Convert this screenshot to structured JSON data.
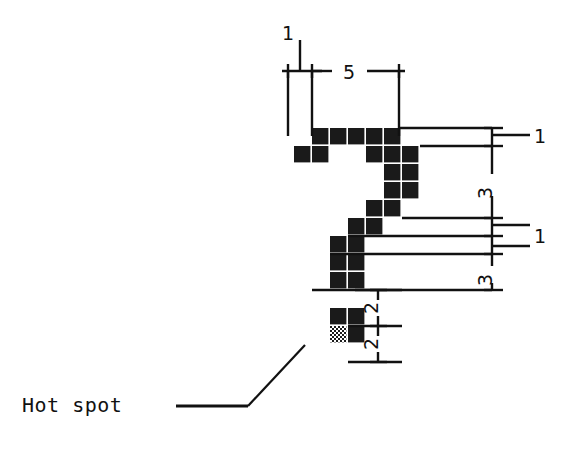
{
  "diagram": {
    "kind": "cursor-bitmap-dimension-drawing",
    "colors": {
      "background": "#ffffff",
      "pixel_fill": "#1a1a1a",
      "line": "#111111",
      "hotspot_pattern": "checkerboard"
    },
    "grid": {
      "cell_size": 18,
      "origin_x": 294,
      "origin_y": 128,
      "columns": 6,
      "rows": 13
    },
    "pixels": [
      {
        "col": 1,
        "row": 0
      },
      {
        "col": 2,
        "row": 0
      },
      {
        "col": 3,
        "row": 0
      },
      {
        "col": 4,
        "row": 0
      },
      {
        "col": 5,
        "row": 0
      },
      {
        "col": 0,
        "row": 1
      },
      {
        "col": 1,
        "row": 1
      },
      {
        "col": 4,
        "row": 1
      },
      {
        "col": 5,
        "row": 1
      },
      {
        "col": 6,
        "row": 1
      },
      {
        "col": 5,
        "row": 2
      },
      {
        "col": 6,
        "row": 2
      },
      {
        "col": 5,
        "row": 3
      },
      {
        "col": 6,
        "row": 3
      },
      {
        "col": 4,
        "row": 4
      },
      {
        "col": 5,
        "row": 4
      },
      {
        "col": 3,
        "row": 5
      },
      {
        "col": 4,
        "row": 5
      },
      {
        "col": 2,
        "row": 6
      },
      {
        "col": 3,
        "row": 6
      },
      {
        "col": 2,
        "row": 7
      },
      {
        "col": 3,
        "row": 7
      },
      {
        "col": 2,
        "row": 8
      },
      {
        "col": 3,
        "row": 8
      },
      {
        "col": 2,
        "row": 10
      },
      {
        "col": 3,
        "row": 10
      },
      {
        "col": 3,
        "row": 11
      }
    ],
    "hotspot_pixel": {
      "col": 2,
      "row": 11
    }
  },
  "dimensions": {
    "top_left_offset": "1",
    "top_width": "5",
    "right_first": "1",
    "right_second": "3",
    "right_third": "1",
    "right_fourth": "3",
    "bottom_first": "2",
    "bottom_second": "2"
  },
  "annotations": {
    "hot_spot_label": "Hot spot"
  }
}
